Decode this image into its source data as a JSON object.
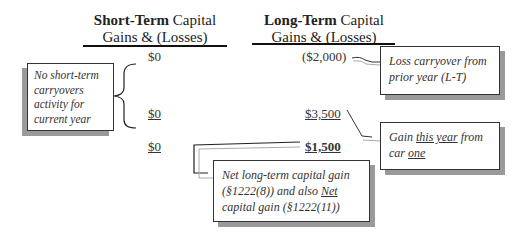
{
  "columns": {
    "short_term": {
      "title_bold": "Short-Term",
      "title_rest": " Capital",
      "title_line2": "Gains & (Losses)"
    },
    "long_term": {
      "title_bold": "Long-Term",
      "title_rest": " Capital",
      "title_line2": "Gains & (Losses)"
    }
  },
  "rows": [
    {
      "short_term": "$0",
      "long_term": "($2,000)"
    },
    {
      "short_term": "$0",
      "long_term": "$3,500"
    },
    {
      "short_term": "$0",
      "long_term": "$1,500"
    }
  ],
  "callouts": {
    "short_term_note": "No short-term carryovers activity for current year",
    "loss_carryover": "Loss carryover from prior year (L-T)",
    "gain_this_year": {
      "pre": "Gain ",
      "underlined": "this year",
      "mid": " from car ",
      "underlined2": "one"
    },
    "net_lt": {
      "pre": "Net long-term capital gain (§1222(8)) and also ",
      "underlined": "Net",
      "post": " capital gain (§1222(11))"
    }
  }
}
